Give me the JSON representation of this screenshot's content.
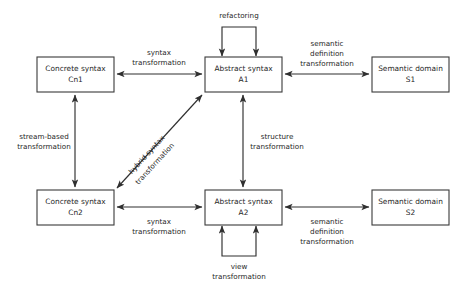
{
  "diagram": {
    "background_color": "#ffffff",
    "line_color": "#2f2f2f",
    "box_border_color": "#3a3a3a",
    "text_color": "#262626",
    "nodes": [
      {
        "id": "cn1",
        "line1": "Concrete syntax",
        "line2": "Cn1",
        "x": 37,
        "y": 57,
        "w": 77,
        "h": 35
      },
      {
        "id": "a1",
        "line1": "Abstract syntax",
        "line2": "A1",
        "x": 205,
        "y": 57,
        "w": 77,
        "h": 35
      },
      {
        "id": "s1",
        "line1": "Semantic domain",
        "line2": "S1",
        "x": 372,
        "y": 57,
        "w": 77,
        "h": 35
      },
      {
        "id": "cn2",
        "line1": "Concrete syntax",
        "line2": "Cn2",
        "x": 37,
        "y": 190,
        "w": 77,
        "h": 35
      },
      {
        "id": "a2",
        "line1": "Abstract syntax",
        "line2": "A2",
        "x": 205,
        "y": 190,
        "w": 77,
        "h": 35
      },
      {
        "id": "s2",
        "line1": "Semantic domain",
        "line2": "S2",
        "x": 372,
        "y": 190,
        "w": 77,
        "h": 35
      }
    ],
    "edges": [
      {
        "id": "syntax-transformation-top",
        "from": "cn1",
        "to": "a1",
        "label_line1": "syntax",
        "label_line2": "transformation",
        "direction": "bidirectional",
        "orientation": "horizontal"
      },
      {
        "id": "semantic-definition-transformation-top",
        "from": "a1",
        "to": "s1",
        "label_line1": "semantic",
        "label_line2": "definition",
        "label_line3": "transformation",
        "direction": "bidirectional",
        "orientation": "horizontal"
      },
      {
        "id": "stream-based-transformation",
        "from": "cn1",
        "to": "cn2",
        "label_line1": "stream-based",
        "label_line2": "transformation",
        "direction": "bidirectional",
        "orientation": "vertical"
      },
      {
        "id": "structure-transformation",
        "from": "a1",
        "to": "a2",
        "label_line1": "structure",
        "label_line2": "transformation",
        "direction": "bidirectional",
        "orientation": "vertical"
      },
      {
        "id": "hybrid-syntax-transformation",
        "from": "cn2",
        "to": "a1",
        "label_line1": "hybrid syntax",
        "label_line2": "transformation",
        "direction": "bidirectional",
        "orientation": "diagonal"
      },
      {
        "id": "syntax-transformation-bottom",
        "from": "cn2",
        "to": "a2",
        "label_line1": "syntax",
        "label_line2": "transformation",
        "direction": "bidirectional",
        "orientation": "horizontal"
      },
      {
        "id": "semantic-definition-transformation-bottom",
        "from": "a2",
        "to": "s2",
        "label_line1": "semantic",
        "label_line2": "definition",
        "label_line3": "transformation",
        "direction": "bidirectional",
        "orientation": "horizontal"
      },
      {
        "id": "refactoring",
        "from": "a1",
        "to": "a1",
        "label_line1": "refactoring",
        "direction": "self-loop-top",
        "orientation": "loop"
      },
      {
        "id": "view-transformation",
        "from": "a2",
        "to": "a2",
        "label_line1": "view",
        "label_line2": "transformation",
        "direction": "self-loop-bottom",
        "orientation": "loop"
      }
    ]
  }
}
